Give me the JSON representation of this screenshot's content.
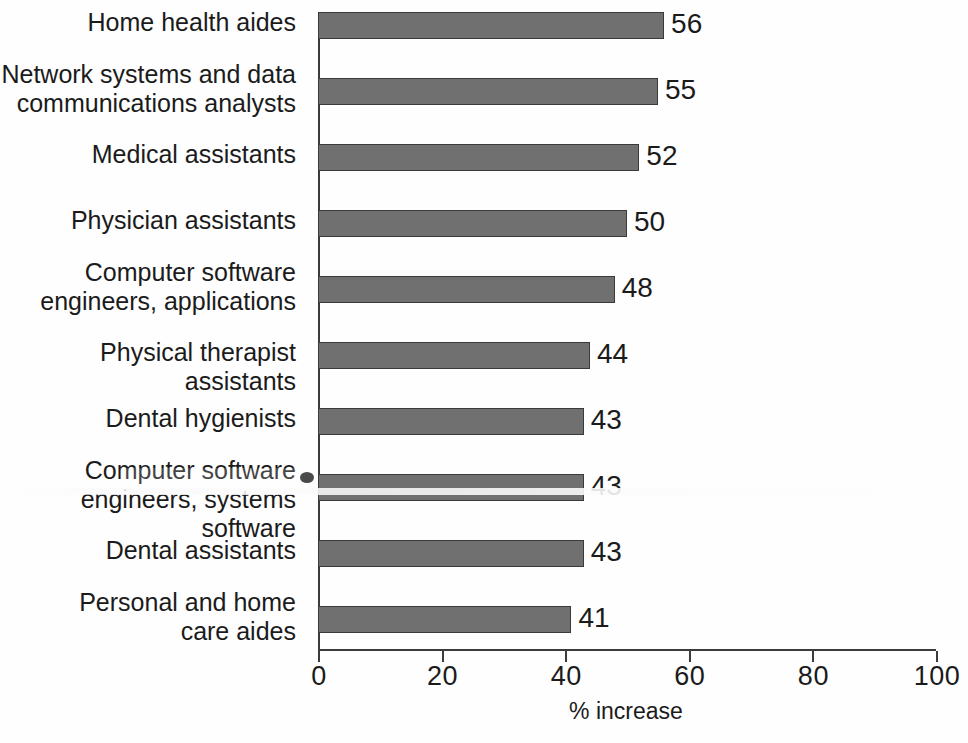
{
  "chart_data": {
    "type": "bar",
    "orientation": "horizontal",
    "title": "",
    "subtitle": "",
    "xlabel": "% increase",
    "ylabel": "",
    "xlim": [
      0,
      100
    ],
    "xticks": [
      0,
      20,
      40,
      60,
      80,
      100
    ],
    "xtick_labels": [
      "0",
      "20",
      "40",
      "60",
      "80",
      "100"
    ],
    "grid": false,
    "legend": false,
    "bar_color": "#707070",
    "bar_edge_color": "#3a3a3a",
    "axis_color": "#3b3b3b",
    "background_color": "#fefefe",
    "text_color": "#1b1b1b",
    "data_labels_shown": true,
    "categories": [
      "Home health aides",
      "Network systems and data\ncommunications analysts",
      "Medical assistants",
      "Physician assistants",
      "Computer software\nengineers, applications",
      "Physical therapist assistants",
      "Dental hygienists",
      "Computer software\nengineers, systems software",
      "Dental assistants",
      "Personal and home\ncare aides"
    ],
    "values": [
      56,
      55,
      52,
      50,
      48,
      44,
      43,
      43,
      43,
      41
    ],
    "value_labels": [
      "56",
      "55",
      "52",
      "50",
      "48",
      "44",
      "43",
      "43",
      "43",
      "41"
    ],
    "bars": [
      {
        "category": "Home health aides",
        "value": 56,
        "label": "56"
      },
      {
        "category": "Network systems and data communications analysts",
        "value": 55,
        "label": "55"
      },
      {
        "category": "Medical assistants",
        "value": 52,
        "label": "52"
      },
      {
        "category": "Physician assistants",
        "value": 50,
        "label": "50"
      },
      {
        "category": "Computer software engineers, applications",
        "value": 48,
        "label": "48"
      },
      {
        "category": "Physical therapist assistants",
        "value": 44,
        "label": "44"
      },
      {
        "category": "Dental hygienists",
        "value": 43,
        "label": "43"
      },
      {
        "category": "Computer software engineers, systems software",
        "value": 43,
        "label": "43"
      },
      {
        "category": "Dental assistants",
        "value": 43,
        "label": "43"
      },
      {
        "category": "Personal and home care aides",
        "value": 41,
        "label": "41"
      }
    ]
  }
}
